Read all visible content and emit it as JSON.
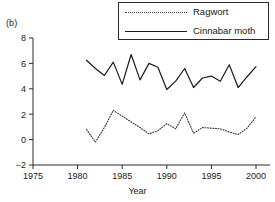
{
  "figure": {
    "panel_label": "(b)",
    "legend": {
      "items": [
        {
          "label": "Ragwort",
          "style": "dotted",
          "color": "#3a3a3a"
        },
        {
          "label": "Cinnabar moth",
          "style": "solid",
          "color": "#1a1a1a"
        }
      ]
    }
  },
  "chart_data": {
    "type": "line",
    "title": "",
    "xlabel": "Year",
    "ylabel": "",
    "xlim": [
      1973.5,
      2002
    ],
    "ylim": [
      -2.8,
      8.6
    ],
    "xticks": [
      1975,
      1980,
      1985,
      1990,
      1995,
      2000
    ],
    "xticklabels": [
      "1975",
      "1980",
      "1985",
      "1990",
      "1995",
      "2000"
    ],
    "yticks": [
      -2,
      0,
      2,
      4,
      6,
      8
    ],
    "yticklabels": [
      "−2",
      "0",
      "2",
      "4",
      "6",
      "8"
    ],
    "grid": false,
    "legend_position": "top-right",
    "x": [
      1981,
      1982,
      1983,
      1984,
      1985,
      1986,
      1987,
      1988,
      1989,
      1990,
      1991,
      1992,
      1993,
      1994,
      1995,
      1996,
      1997,
      1998,
      1999,
      2000
    ],
    "series": [
      {
        "name": "Cinnabar moth",
        "style": "solid",
        "color": "#1a1a1a",
        "values": [
          6.25,
          5.6,
          5.05,
          6.1,
          4.35,
          6.7,
          4.7,
          6.0,
          5.7,
          3.95,
          4.6,
          5.6,
          4.1,
          4.85,
          5.0,
          4.6,
          5.9,
          4.1,
          4.95,
          5.75
        ]
      },
      {
        "name": "Ragwort",
        "style": "dotted",
        "color": "#3a3a3a",
        "values": [
          0.8,
          -0.2,
          0.95,
          2.3,
          1.85,
          1.4,
          0.95,
          0.45,
          0.7,
          1.25,
          0.85,
          2.1,
          0.5,
          0.95,
          0.9,
          0.85,
          0.6,
          0.4,
          0.9,
          1.8
        ]
      }
    ]
  }
}
